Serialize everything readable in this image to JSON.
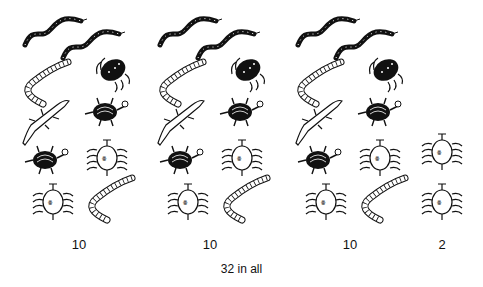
{
  "figure": {
    "groups": [
      {
        "label": "10",
        "animals": [
          "snake",
          "snake",
          "worm",
          "beetle-dark",
          "lizard",
          "turtle",
          "turtle",
          "centipede",
          "centipede",
          "worm"
        ]
      },
      {
        "label": "10",
        "animals": [
          "snake",
          "snake",
          "worm",
          "beetle-dark",
          "lizard",
          "turtle",
          "turtle",
          "centipede",
          "centipede",
          "worm"
        ]
      },
      {
        "label": "10",
        "animals": [
          "snake",
          "snake",
          "worm",
          "beetle-dark",
          "lizard",
          "turtle",
          "turtle",
          "centipede",
          "centipede",
          "worm"
        ]
      },
      {
        "label": "2",
        "animals": [
          "centipede",
          "centipede"
        ]
      }
    ],
    "total_label": "32 in all"
  }
}
